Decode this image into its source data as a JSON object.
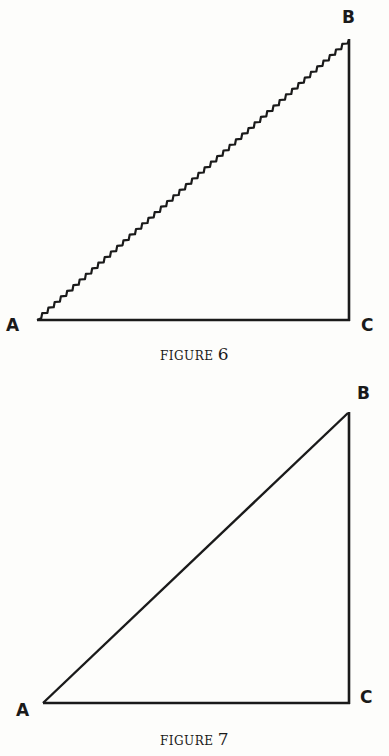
{
  "figures": [
    {
      "caption_word": "FIGURE",
      "caption_number": "6",
      "vertices": {
        "A": {
          "label": "A",
          "x": 37,
          "y": 320
        },
        "B": {
          "label": "B",
          "x": 349,
          "y": 40
        },
        "C": {
          "label": "C",
          "x": 349,
          "y": 320
        }
      },
      "hypotenuse_style": "wavy",
      "right_angle_at": "C"
    },
    {
      "caption_word": "FIGURE",
      "caption_number": "7",
      "vertices": {
        "A": {
          "label": "A",
          "x": 43,
          "y": 703
        },
        "B": {
          "label": "B",
          "x": 348,
          "y": 414
        },
        "C": {
          "label": "C",
          "x": 349,
          "y": 703
        }
      },
      "hypotenuse_style": "straight",
      "right_angle_at": "C"
    }
  ],
  "colors": {
    "ink": "#1a1a1a",
    "paper": "#fdfdfb"
  }
}
